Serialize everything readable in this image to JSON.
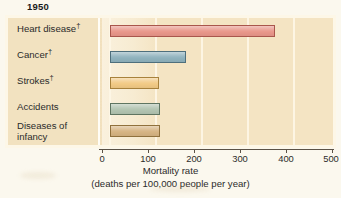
{
  "chart_data": {
    "type": "bar",
    "orientation": "horizontal",
    "title": "1950",
    "subtitle": "",
    "categories": [
      "Heart disease†",
      "Cancer†",
      "Strokes†",
      "Accidents",
      "Diseases of infancy"
    ],
    "values": [
      362,
      166,
      107,
      109,
      109
    ],
    "xlabel": "Mortality rate",
    "xlabel_line2": "(deaths per 100,000 people per year)",
    "ylabel": "",
    "xlim": [
      0,
      500
    ],
    "xticks": [
      0,
      100,
      200,
      300,
      400,
      500
    ],
    "xticklabels": [
      "0",
      "100",
      "200",
      "300",
      "400",
      "500"
    ],
    "grid": "vertical gridlines at each 100 unit tick",
    "legend": "none",
    "bar_colors": [
      "#e8968a",
      "#8fb2bd",
      "#f2ca85",
      "#b2c4b1",
      "#d6b483"
    ]
  },
  "figure": {
    "title": "1950",
    "panel_background": "#f4e4c3",
    "panel_border": "#fdf7e7",
    "page_background": "#fbf8ee",
    "label_column_background": "#f2e2c0"
  },
  "categories": [
    {
      "label": "Heart disease",
      "dagger": "†",
      "value": 362,
      "color": "#e8968a",
      "border": "#a9564c"
    },
    {
      "label": "Cancer",
      "dagger": "†",
      "value": 166,
      "color": "#8fb2bd",
      "border": "#4e6f7c"
    },
    {
      "label": "Strokes",
      "dagger": "†",
      "value": 107,
      "color": "#f2ca85",
      "border": "#a8823c"
    },
    {
      "label": "Accidents",
      "dagger": "",
      "value": 109,
      "color": "#b2c4b1",
      "border": "#5f7561"
    },
    {
      "label": "Diseases of",
      "label2": "infancy",
      "dagger": "",
      "value": 109,
      "color": "#d6b483",
      "border": "#90713d"
    }
  ],
  "axis": {
    "ticks": [
      {
        "label": "0"
      },
      {
        "label": "100"
      },
      {
        "label": "200"
      },
      {
        "label": "300"
      },
      {
        "label": "400"
      },
      {
        "label": "500"
      }
    ],
    "title_line1": "Mortality rate",
    "title_line2": "(deaths per 100,000 people per year)"
  }
}
